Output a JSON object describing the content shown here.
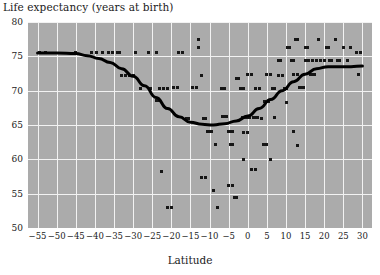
{
  "chart_data": {
    "type": "scatter",
    "title": "Life expectancy (years at birth)",
    "xlabel": "Latitude",
    "ylabel": "Life expectancy (years at birth)",
    "xlim": [
      -57.5,
      32.5
    ],
    "ylim": [
      50,
      80
    ],
    "xticks": [
      -55,
      -50,
      -45,
      -40,
      -35,
      -30,
      -25,
      -20,
      -15,
      -10,
      -5,
      0,
      5,
      10,
      15,
      20,
      25,
      30
    ],
    "xticklabels": [
      "−55",
      "−50",
      "−45",
      "−40",
      "−35",
      "−30",
      "−25",
      "−20",
      "−15",
      "−10",
      "−5",
      "0",
      "5",
      "10",
      "15",
      "20",
      "25",
      "30"
    ],
    "yticks": [
      50,
      55,
      60,
      65,
      70,
      75,
      80
    ],
    "yticklabels": [
      "50",
      "55",
      "60",
      "65",
      "70",
      "75",
      "80"
    ],
    "grid": true,
    "legend": null,
    "plot_bgcolor": "#ababab",
    "grid_color": "#f2f2f2",
    "marker_color": "#161616",
    "curve_color": "#000000",
    "points": [
      [
        -54.5,
        75.6
      ],
      [
        -53.0,
        75.6
      ],
      [
        -45.0,
        75.5
      ],
      [
        -41.0,
        75.6
      ],
      [
        -39.5,
        75.6
      ],
      [
        -38.0,
        75.5
      ],
      [
        -36.5,
        75.6
      ],
      [
        -35.5,
        75.6
      ],
      [
        -34.0,
        75.6
      ],
      [
        -33.0,
        72.2
      ],
      [
        -32.0,
        72.2
      ],
      [
        -31.0,
        72.2
      ],
      [
        -30.0,
        72.2
      ],
      [
        -35.5,
        75.6
      ],
      [
        -33.5,
        75.6
      ],
      [
        -29.5,
        75.5
      ],
      [
        -28.0,
        70.3
      ],
      [
        -25.5,
        70.3
      ],
      [
        -26.0,
        75.5
      ],
      [
        -24.0,
        75.5
      ],
      [
        -23.0,
        70.3
      ],
      [
        -22.0,
        70.3
      ],
      [
        -21.0,
        70.3
      ],
      [
        -24.0,
        68.5
      ],
      [
        -23.0,
        68.5
      ],
      [
        -22.5,
        58.2
      ],
      [
        -21.0,
        53.0
      ],
      [
        -20.0,
        53.0
      ],
      [
        -19.5,
        70.4
      ],
      [
        -18.5,
        70.4
      ],
      [
        -18.0,
        75.5
      ],
      [
        -17.0,
        75.5
      ],
      [
        -16.0,
        66.0
      ],
      [
        -15.5,
        66.0
      ],
      [
        -14.5,
        70.4
      ],
      [
        -13.5,
        70.4
      ],
      [
        -13.0,
        77.5
      ],
      [
        -13.0,
        76.3
      ],
      [
        -12.0,
        72.2
      ],
      [
        -11.5,
        66.0
      ],
      [
        -11.0,
        66.0
      ],
      [
        -10.5,
        64.0
      ],
      [
        -10.0,
        64.0
      ],
      [
        -9.5,
        64.0
      ],
      [
        -9.0,
        55.5
      ],
      [
        -8.5,
        62.2
      ],
      [
        -12.0,
        57.3
      ],
      [
        -11.0,
        57.3
      ],
      [
        -8.0,
        53.0
      ],
      [
        -7.0,
        70.3
      ],
      [
        -6.0,
        70.3
      ],
      [
        -6.5,
        66.2
      ],
      [
        -6.0,
        66.2
      ],
      [
        -5.5,
        66.2
      ],
      [
        -5.0,
        64.0
      ],
      [
        -4.5,
        64.0
      ],
      [
        -4.0,
        64.0
      ],
      [
        -4.5,
        62.2
      ],
      [
        -4.0,
        62.2
      ],
      [
        -5.0,
        56.2
      ],
      [
        -4.0,
        56.2
      ],
      [
        -3.5,
        54.5
      ],
      [
        -3.0,
        54.5
      ],
      [
        -3.0,
        71.8
      ],
      [
        -2.5,
        71.8
      ],
      [
        -2.0,
        70.3
      ],
      [
        -1.5,
        70.3
      ],
      [
        -1.0,
        70.3
      ],
      [
        -1.5,
        66.1
      ],
      [
        -1.0,
        66.1
      ],
      [
        -0.5,
        66.1
      ],
      [
        0.0,
        66.1
      ],
      [
        0.5,
        66.1
      ],
      [
        -1.0,
        63.9
      ],
      [
        0.0,
        63.9
      ],
      [
        -1.0,
        60.0
      ],
      [
        0.0,
        72.3
      ],
      [
        1.0,
        72.3
      ],
      [
        1.5,
        66.1
      ],
      [
        2.0,
        66.1
      ],
      [
        2.5,
        66.1
      ],
      [
        2.0,
        70.3
      ],
      [
        3.0,
        70.3
      ],
      [
        1.0,
        58.5
      ],
      [
        2.0,
        58.5
      ],
      [
        3.5,
        66.0
      ],
      [
        4.0,
        62.1
      ],
      [
        5.0,
        62.1
      ],
      [
        4.5,
        68.4
      ],
      [
        5.5,
        68.4
      ],
      [
        5.0,
        72.3
      ],
      [
        6.0,
        72.3
      ],
      [
        6.5,
        70.3
      ],
      [
        7.0,
        70.3
      ],
      [
        7.0,
        66.1
      ],
      [
        6.0,
        60.0
      ],
      [
        8.0,
        74.4
      ],
      [
        8.5,
        74.4
      ],
      [
        8.0,
        72.2
      ],
      [
        9.0,
        72.2
      ],
      [
        9.5,
        70.3
      ],
      [
        10.0,
        70.3
      ],
      [
        10.5,
        76.3
      ],
      [
        11.0,
        76.3
      ],
      [
        10.0,
        68.3
      ],
      [
        11.5,
        74.4
      ],
      [
        12.0,
        74.4
      ],
      [
        12.5,
        77.5
      ],
      [
        13.0,
        77.5
      ],
      [
        12.0,
        72.3
      ],
      [
        13.0,
        72.3
      ],
      [
        13.5,
        70.4
      ],
      [
        14.0,
        70.4
      ],
      [
        14.5,
        70.4
      ],
      [
        12.0,
        64.0
      ],
      [
        13.0,
        62.0
      ],
      [
        15.0,
        76.3
      ],
      [
        15.5,
        76.3
      ],
      [
        15.0,
        74.4
      ],
      [
        16.0,
        74.4
      ],
      [
        16.5,
        72.3
      ],
      [
        17.0,
        72.3
      ],
      [
        17.5,
        72.3
      ],
      [
        17.0,
        74.4
      ],
      [
        18.0,
        74.4
      ],
      [
        18.5,
        77.5
      ],
      [
        19.0,
        74.4
      ],
      [
        20.0,
        74.4
      ],
      [
        20.5,
        76.3
      ],
      [
        21.0,
        76.3
      ],
      [
        21.5,
        74.4
      ],
      [
        22.0,
        74.4
      ],
      [
        23.0,
        77.5
      ],
      [
        23.5,
        74.4
      ],
      [
        24.0,
        74.4
      ],
      [
        25.0,
        76.3
      ],
      [
        26.0,
        74.4
      ],
      [
        27.0,
        76.3
      ],
      [
        28.5,
        75.5
      ],
      [
        29.5,
        75.5
      ],
      [
        29.0,
        72.3
      ]
    ],
    "fitted_curve": {
      "label": "smoothed trend",
      "x": [
        -55,
        -50,
        -45,
        -42,
        -39,
        -36,
        -33,
        -30,
        -27,
        -24,
        -21,
        -18,
        -15,
        -12,
        -9,
        -6,
        -3,
        0,
        3,
        6,
        9,
        12,
        15,
        18,
        21,
        24,
        27,
        30
      ],
      "y": [
        75.5,
        75.5,
        75.4,
        75.1,
        74.7,
        74.1,
        73.2,
        72.1,
        70.7,
        69.0,
        67.4,
        66.2,
        65.4,
        65.1,
        65.0,
        65.2,
        65.6,
        66.3,
        67.4,
        68.7,
        70.0,
        71.3,
        72.4,
        73.2,
        73.5,
        73.5,
        73.5,
        73.6
      ]
    }
  }
}
